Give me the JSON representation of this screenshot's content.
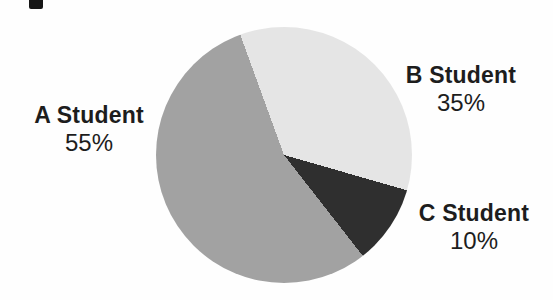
{
  "chart_data": {
    "type": "pie",
    "title": "",
    "start_angle_deg": -20,
    "clockwise": true,
    "legend": "none",
    "labels_position": "outside",
    "segments": [
      {
        "label": "B Student",
        "value": 35,
        "display": "35%",
        "color": "#e5e5e5"
      },
      {
        "label": "C Student",
        "value": 10,
        "display": "10%",
        "color": "#2f2f2f"
      },
      {
        "label": "A Student",
        "value": 55,
        "display": "55%",
        "color": "#a2a2a2"
      }
    ],
    "text_color": "#1d1d1d",
    "background_color": "#fefefe"
  }
}
